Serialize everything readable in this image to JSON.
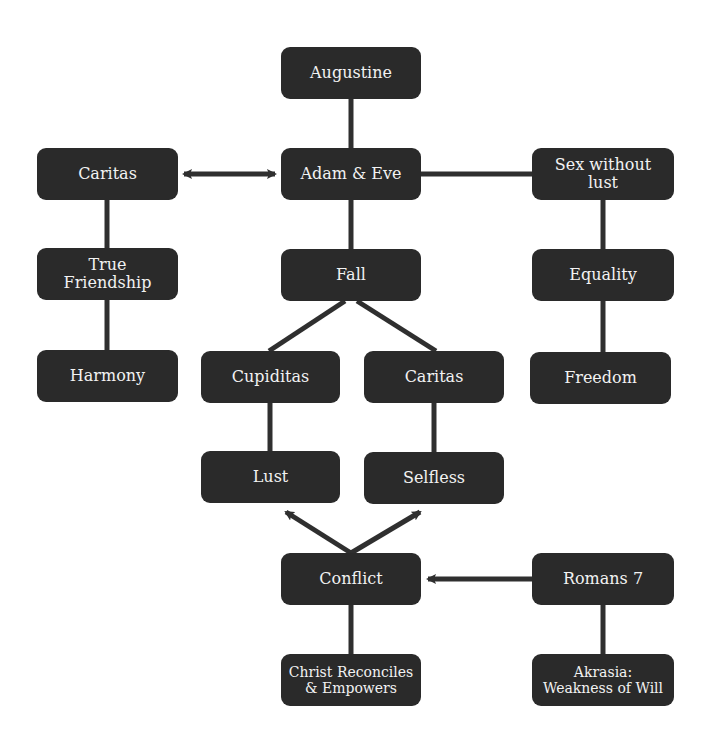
{
  "diagram": {
    "colors": {
      "node_fill": "#2a2a2a",
      "node_text": "#f2f2f2",
      "line": "#2f2f2f",
      "background": "#ffffff"
    },
    "nodes": {
      "augustine": "Augustine",
      "adam_eve": "Adam & Eve",
      "caritas_left": "Caritas",
      "sex_without_lust": "Sex without\nlust",
      "true_friendship": "True\nFriendship",
      "fall": "Fall",
      "equality": "Equality",
      "harmony": "Harmony",
      "cupiditas": "Cupiditas",
      "caritas_mid": "Caritas",
      "freedom": "Freedom",
      "lust": "Lust",
      "selfless": "Selfless",
      "conflict": "Conflict",
      "romans7": "Romans 7",
      "christ_reconciles": "Christ Reconciles\n& Empowers",
      "akrasia": "Akrasia:\nWeakness of Will"
    },
    "edges": [
      {
        "from": "Augustine",
        "to": "Adam & Eve",
        "type": "line"
      },
      {
        "from": "Adam & Eve",
        "to": "Caritas",
        "type": "double-arrow"
      },
      {
        "from": "Adam & Eve",
        "to": "Sex without lust",
        "type": "line"
      },
      {
        "from": "Adam & Eve",
        "to": "Fall",
        "type": "line"
      },
      {
        "from": "Caritas",
        "to": "True Friendship",
        "type": "line"
      },
      {
        "from": "True Friendship",
        "to": "Harmony",
        "type": "line"
      },
      {
        "from": "Sex without lust",
        "to": "Equality",
        "type": "line"
      },
      {
        "from": "Equality",
        "to": "Freedom",
        "type": "line"
      },
      {
        "from": "Fall",
        "to": "Cupiditas",
        "type": "line"
      },
      {
        "from": "Fall",
        "to": "Caritas",
        "type": "line"
      },
      {
        "from": "Cupiditas",
        "to": "Lust",
        "type": "line"
      },
      {
        "from": "Caritas",
        "to": "Selfless",
        "type": "line"
      },
      {
        "from": "Conflict",
        "to": "Lust",
        "type": "arrow"
      },
      {
        "from": "Conflict",
        "to": "Selfless",
        "type": "arrow"
      },
      {
        "from": "Romans 7",
        "to": "Conflict",
        "type": "arrow"
      },
      {
        "from": "Conflict",
        "to": "Christ Reconciles & Empowers",
        "type": "line"
      },
      {
        "from": "Romans 7",
        "to": "Akrasia: Weakness of Will",
        "type": "line"
      }
    ]
  }
}
